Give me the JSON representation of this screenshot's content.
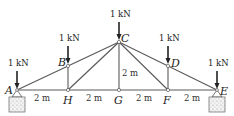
{
  "diagram": {
    "type": "truss",
    "nodes": [
      {
        "id": "A",
        "label": "A",
        "x": 17,
        "y": 90
      },
      {
        "id": "H",
        "label": "H",
        "x": 68,
        "y": 90
      },
      {
        "id": "G",
        "label": "G",
        "x": 119,
        "y": 90
      },
      {
        "id": "F",
        "label": "F",
        "x": 168,
        "y": 90
      },
      {
        "id": "E",
        "label": "E",
        "x": 217,
        "y": 90
      },
      {
        "id": "B",
        "label": "B",
        "x": 68,
        "y": 66
      },
      {
        "id": "C",
        "label": "C",
        "x": 119,
        "y": 42
      },
      {
        "id": "D",
        "label": "D",
        "x": 168,
        "y": 66
      }
    ],
    "members": [
      [
        "A",
        "H"
      ],
      [
        "H",
        "G"
      ],
      [
        "G",
        "F"
      ],
      [
        "F",
        "E"
      ],
      [
        "A",
        "B"
      ],
      [
        "B",
        "C"
      ],
      [
        "C",
        "D"
      ],
      [
        "D",
        "E"
      ],
      [
        "B",
        "H"
      ],
      [
        "C",
        "G"
      ],
      [
        "D",
        "F"
      ],
      [
        "H",
        "C"
      ],
      [
        "C",
        "F"
      ]
    ],
    "loads": [
      {
        "node": "A",
        "label": "1 kN"
      },
      {
        "node": "B",
        "label": "1 kN"
      },
      {
        "node": "C",
        "label": "1 kN"
      },
      {
        "node": "D",
        "label": "1 kN"
      },
      {
        "node": "E",
        "label": "1 kN"
      }
    ],
    "dimensions": [
      {
        "label": "2 m",
        "between": [
          "A",
          "H"
        ]
      },
      {
        "label": "2 m",
        "between": [
          "H",
          "G"
        ]
      },
      {
        "label": "2 m",
        "between": [
          "G",
          "F"
        ]
      },
      {
        "label": "2 m",
        "between": [
          "F",
          "E"
        ]
      },
      {
        "label": "2 m",
        "between": [
          "G",
          "C"
        ],
        "orientation": "vertical"
      }
    ],
    "supports": [
      {
        "node": "A",
        "type": "pin-block"
      },
      {
        "node": "E",
        "type": "pin-block"
      }
    ]
  },
  "labels": {
    "A": "A",
    "B": "B",
    "C": "C",
    "D": "D",
    "E": "E",
    "F": "F",
    "G": "G",
    "H": "H",
    "load_A": "1 kN",
    "load_B": "1 kN",
    "load_C": "1 kN",
    "load_D": "1 kN",
    "load_E": "1 kN",
    "dim_AH": "2 m",
    "dim_HG": "2 m",
    "dim_GF": "2 m",
    "dim_FE": "2 m",
    "dim_GC": "2 m"
  },
  "colors": {
    "member": "#555555",
    "load": "#222222",
    "support_fill": "#e8e8e8"
  }
}
